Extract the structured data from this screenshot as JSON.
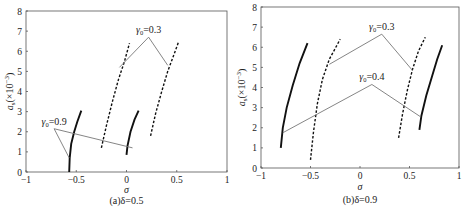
{
  "chart_data": [
    {
      "type": "line",
      "panel": "a",
      "caption": "(a)δ=0.5",
      "xlabel": "σ",
      "ylabel": "a_s(×10⁻³)",
      "xlim": [
        -1,
        1
      ],
      "ylim": [
        0,
        8
      ],
      "xticks": [
        "-1",
        "-0.5",
        "0",
        "0.5",
        "1"
      ],
      "yticks": [
        "0",
        "1",
        "2",
        "3",
        "4",
        "5",
        "6",
        "7",
        "8"
      ],
      "grid": false,
      "series": [
        {
          "name": "solid-1",
          "style": "solid-thick",
          "points": [
            [
              -0.57,
              0.0
            ],
            [
              -0.565,
              0.7
            ],
            [
              -0.55,
              1.4
            ],
            [
              -0.52,
              2.0
            ],
            [
              -0.49,
              2.5
            ],
            [
              -0.45,
              3.05
            ]
          ]
        },
        {
          "name": "solid-2",
          "style": "solid-thick",
          "points": [
            [
              0.0,
              0.85
            ],
            [
              0.01,
              1.3
            ],
            [
              0.04,
              2.0
            ],
            [
              0.08,
              2.6
            ],
            [
              0.12,
              3.05
            ]
          ]
        },
        {
          "name": "dashed-1",
          "style": "dashed",
          "points": [
            [
              -0.25,
              1.2
            ],
            [
              -0.2,
              2.3
            ],
            [
              -0.14,
              3.5
            ],
            [
              -0.08,
              4.6
            ],
            [
              -0.02,
              5.5
            ],
            [
              0.03,
              6.4
            ]
          ]
        },
        {
          "name": "dashed-2",
          "style": "dashed",
          "points": [
            [
              0.24,
              1.8
            ],
            [
              0.29,
              2.9
            ],
            [
              0.35,
              4.0
            ],
            [
              0.41,
              5.0
            ],
            [
              0.47,
              5.8
            ],
            [
              0.52,
              6.5
            ]
          ]
        }
      ],
      "annotations": [
        {
          "label": "γ0=0.3",
          "label_sub": "0",
          "text_main": "γ",
          "text_value": "=0.3",
          "apex": [
            0.22,
            6.7
          ],
          "targets": [
            [
              -0.07,
              5.2
            ],
            [
              0.41,
              5.3
            ]
          ]
        },
        {
          "label": "γ0=0.9",
          "label_sub": "0",
          "text_main": "γ",
          "text_value": "=0.9",
          "apex": [
            -0.72,
            2.15
          ],
          "targets": [
            [
              -0.57,
              0.7
            ],
            [
              0.06,
              1.2
            ]
          ]
        }
      ]
    },
    {
      "type": "line",
      "panel": "b",
      "caption": "(b)δ=0.9",
      "xlabel": "σ",
      "ylabel": "a_s(×10⁻³)",
      "xlim": [
        -1,
        1
      ],
      "ylim": [
        0,
        8
      ],
      "xticks": [
        "-1",
        "-0.5",
        "0",
        "0.5",
        "1"
      ],
      "yticks": [
        "0",
        "1",
        "2",
        "3",
        "4",
        "5",
        "6",
        "7",
        "8"
      ],
      "grid": false,
      "series": [
        {
          "name": "solid-1",
          "style": "solid-thick",
          "points": [
            [
              -0.8,
              1.0
            ],
            [
              -0.78,
              2.0
            ],
            [
              -0.74,
              3.0
            ],
            [
              -0.68,
              4.1
            ],
            [
              -0.61,
              5.2
            ],
            [
              -0.53,
              6.2
            ]
          ]
        },
        {
          "name": "solid-2",
          "style": "solid-thick",
          "points": [
            [
              0.6,
              1.9
            ],
            [
              0.62,
              2.6
            ],
            [
              0.67,
              3.6
            ],
            [
              0.73,
              4.6
            ],
            [
              0.78,
              5.4
            ],
            [
              0.83,
              6.1
            ]
          ]
        },
        {
          "name": "dashed-1",
          "style": "dashed",
          "points": [
            [
              -0.5,
              0.4
            ],
            [
              -0.47,
              1.8
            ],
            [
              -0.43,
              3.2
            ],
            [
              -0.38,
              4.4
            ],
            [
              -0.31,
              5.4
            ],
            [
              -0.2,
              6.4
            ]
          ]
        },
        {
          "name": "dashed-2",
          "style": "dashed",
          "points": [
            [
              0.39,
              1.5
            ],
            [
              0.43,
              2.7
            ],
            [
              0.48,
              3.9
            ],
            [
              0.53,
              4.9
            ],
            [
              0.59,
              5.8
            ],
            [
              0.66,
              6.5
            ]
          ]
        }
      ],
      "annotations": [
        {
          "label": "γ0=0.3",
          "label_sub": "0",
          "text_main": "γ",
          "text_value": "=0.3",
          "apex": [
            0.22,
            6.65
          ],
          "targets": [
            [
              -0.31,
              5.15
            ],
            [
              0.53,
              4.85
            ]
          ]
        },
        {
          "label": "γ0=0.4",
          "label_sub": "0",
          "text_main": "γ",
          "text_value": "=0.4",
          "apex": [
            0.12,
            4.15
          ],
          "targets": [
            [
              -0.78,
              1.75
            ],
            [
              0.61,
              2.55
            ]
          ]
        }
      ]
    }
  ],
  "colors": {
    "axis": "#555555",
    "curve": "#111111",
    "annotation_line": "#777777",
    "text": "#222222"
  }
}
